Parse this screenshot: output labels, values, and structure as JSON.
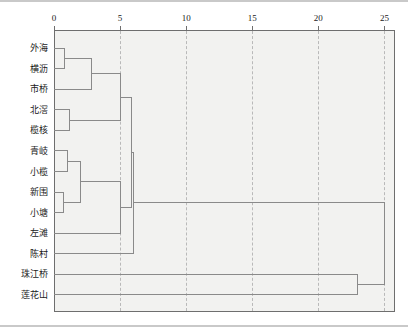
{
  "figure": {
    "title": "",
    "background_color": "#ffffff",
    "plot_background_color": "#f2f2f0",
    "frame_color": "#6e6e6e",
    "link_color": "#8a8a8a",
    "grid_color": "#b9b9b9"
  },
  "chart_data": {
    "type": "dendrogram",
    "title": "",
    "xlabel": "",
    "ylabel": "",
    "orientation": "horizontal",
    "xlim": [
      0,
      25.8
    ],
    "grid": true,
    "legend": null,
    "axis": {
      "ticks": [
        0,
        5,
        10,
        15,
        20,
        25
      ],
      "tick_labels": [
        "0",
        "5",
        "10",
        "15",
        "20",
        "25"
      ],
      "position": "top"
    },
    "leaves": [
      "外海",
      "横沥",
      "市桥",
      "北滘",
      "榄核",
      "青岐",
      "小榄",
      "新围",
      "小塘",
      "左滩",
      "陈村",
      "珠江桥",
      "莲花山"
    ],
    "merges": [
      {
        "id": "m1",
        "members": [
          "外海",
          "横沥"
        ],
        "distance": 0.8
      },
      {
        "id": "m2",
        "members": [
          "m1",
          "市桥"
        ],
        "distance": 2.8
      },
      {
        "id": "m3",
        "members": [
          "北滘",
          "榄核"
        ],
        "distance": 1.2
      },
      {
        "id": "m4",
        "members": [
          "m3"
        ],
        "distance": 2.2
      },
      {
        "id": "m5",
        "members": [
          "m2",
          "m4"
        ],
        "distance": 5.0
      },
      {
        "id": "m6",
        "members": [
          "青岐",
          "小榄"
        ],
        "distance": 1.0
      },
      {
        "id": "m7",
        "members": [
          "新围",
          "小塘"
        ],
        "distance": 0.7
      },
      {
        "id": "m8",
        "members": [
          "m6",
          "m7"
        ],
        "distance": 2.0
      },
      {
        "id": "m9",
        "members": [
          "m8",
          "左滩"
        ],
        "distance": 5.05
      },
      {
        "id": "m10",
        "members": [
          "m5",
          "m9"
        ],
        "distance": 5.9
      },
      {
        "id": "m11",
        "members": [
          "m10",
          "陈村"
        ],
        "distance": 6.0
      },
      {
        "id": "m12",
        "members": [
          "珠江桥",
          "莲花山"
        ],
        "distance": 23.0
      },
      {
        "id": "m13",
        "members": [
          "m11",
          "m12"
        ],
        "distance": 25.0
      }
    ]
  }
}
